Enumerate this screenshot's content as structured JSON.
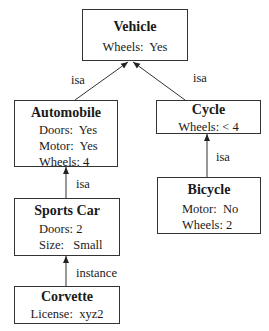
{
  "nodes": {
    "vehicle": {
      "title": "Vehicle",
      "attrs": [
        "Wheels:  Yes"
      ]
    },
    "automobile": {
      "title": "Automobile",
      "attrs": [
        "Doors:  Yes",
        "Motor:  Yes",
        "Wheels: 4"
      ]
    },
    "cycle": {
      "title": "Cycle",
      "attrs": [
        "Wheels: < 4"
      ]
    },
    "bicycle": {
      "title": "Bicycle",
      "attrs": [
        "Motor:  No",
        "Wheels: 2"
      ]
    },
    "sports_car": {
      "title": "Sports Car",
      "attrs": [
        "Doors: 2",
        "Size:   Small"
      ]
    },
    "corvette": {
      "title": "Corvette",
      "attrs": [
        "License:  xyz2"
      ]
    }
  },
  "edges": {
    "automobile_vehicle": "isa",
    "cycle_vehicle": "isa",
    "bicycle_cycle": "isa",
    "sportscar_automobile": "isa",
    "corvette_sportscar": "instance"
  }
}
